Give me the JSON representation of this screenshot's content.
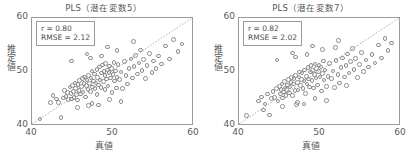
{
  "figure": {
    "width": 415,
    "height": 155,
    "background": "#ffffff",
    "marker_color": "#8d8d8d",
    "axis_color": "#9a9a9a",
    "text_color": "#5a5a5a"
  },
  "chart_data": [
    {
      "type": "scatter",
      "title": "PLS（潜在変数5）",
      "xlabel": "真値",
      "ylabel": "推定値",
      "xlim": [
        40,
        60
      ],
      "ylim": [
        40,
        60
      ],
      "xticks": [
        40,
        50,
        60
      ],
      "yticks": [
        40,
        50,
        60
      ],
      "xtick_labels": [
        "40",
        "50",
        "60"
      ],
      "ytick_labels": [
        "40",
        "50",
        "60"
      ],
      "grid": false,
      "legend": null,
      "reference_line": {
        "type": "identity",
        "from": [
          40,
          40
        ],
        "to": [
          60,
          60
        ],
        "style": "dotted"
      },
      "annotations": {
        "r_label": "r = 0.80",
        "rmse_label": "RMSE = 2.12",
        "r": 0.8,
        "rmse": 2.12
      },
      "marker": {
        "shape": "circle",
        "filled": false,
        "size": 4.6
      },
      "points": [
        [
          41.0,
          41.3
        ],
        [
          42.3,
          44.4
        ],
        [
          42.6,
          45.6
        ],
        [
          43.0,
          45.0
        ],
        [
          43.3,
          44.3
        ],
        [
          43.6,
          41.6
        ],
        [
          43.9,
          45.2
        ],
        [
          44.0,
          46.6
        ],
        [
          44.2,
          45.5
        ],
        [
          44.4,
          46.2
        ],
        [
          44.5,
          44.9
        ],
        [
          44.7,
          47.2
        ],
        [
          44.8,
          46.0
        ],
        [
          44.9,
          45.0
        ],
        [
          45.0,
          47.5
        ],
        [
          45.1,
          46.4
        ],
        [
          45.2,
          45.3
        ],
        [
          45.3,
          48.0
        ],
        [
          45.4,
          46.9
        ],
        [
          45.5,
          45.8
        ],
        [
          45.6,
          44.8
        ],
        [
          45.7,
          47.7
        ],
        [
          45.8,
          46.6
        ],
        [
          45.9,
          48.4
        ],
        [
          46.0,
          45.9
        ],
        [
          46.1,
          47.3
        ],
        [
          46.2,
          48.8
        ],
        [
          46.3,
          46.3
        ],
        [
          46.4,
          47.9
        ],
        [
          46.5,
          49.1
        ],
        [
          46.6,
          45.4
        ],
        [
          46.7,
          47.5
        ],
        [
          46.8,
          48.5
        ],
        [
          46.9,
          46.8
        ],
        [
          47.0,
          49.4
        ],
        [
          47.0,
          43.8
        ],
        [
          47.1,
          47.9
        ],
        [
          47.2,
          46.4
        ],
        [
          47.3,
          48.9
        ],
        [
          47.4,
          50.2
        ],
        [
          47.5,
          47.2
        ],
        [
          47.6,
          48.3
        ],
        [
          47.7,
          49.6
        ],
        [
          47.8,
          46.9
        ],
        [
          47.9,
          48.0
        ],
        [
          48.0,
          50.5
        ],
        [
          48.0,
          45.8
        ],
        [
          48.1,
          49.0
        ],
        [
          48.2,
          47.6
        ],
        [
          48.3,
          50.9
        ],
        [
          48.4,
          48.5
        ],
        [
          48.5,
          47.1
        ],
        [
          48.6,
          49.8
        ],
        [
          48.7,
          51.3
        ],
        [
          48.8,
          48.2
        ],
        [
          48.9,
          50.1
        ],
        [
          49.0,
          46.8
        ],
        [
          49.0,
          49.3
        ],
        [
          49.1,
          51.6
        ],
        [
          49.2,
          48.7
        ],
        [
          49.3,
          50.4
        ],
        [
          49.4,
          47.4
        ],
        [
          49.5,
          49.9
        ],
        [
          49.6,
          51.1
        ],
        [
          49.7,
          48.9
        ],
        [
          49.8,
          50.7
        ],
        [
          49.9,
          46.2
        ],
        [
          50.0,
          49.5
        ],
        [
          50.1,
          51.8
        ],
        [
          50.2,
          48.3
        ],
        [
          50.3,
          50.2
        ],
        [
          50.4,
          47.0
        ],
        [
          50.5,
          49.0
        ],
        [
          50.6,
          51.4
        ],
        [
          50.8,
          48.6
        ],
        [
          51.0,
          50.0
        ],
        [
          51.2,
          46.9
        ],
        [
          51.4,
          51.9
        ],
        [
          51.6,
          49.3
        ],
        [
          51.8,
          47.8
        ],
        [
          52.0,
          50.6
        ],
        [
          52.2,
          52.4
        ],
        [
          52.4,
          48.9
        ],
        [
          52.6,
          51.0
        ],
        [
          52.8,
          53.1
        ],
        [
          53.0,
          49.6
        ],
        [
          53.2,
          51.7
        ],
        [
          53.4,
          54.1
        ],
        [
          53.6,
          50.3
        ],
        [
          53.8,
          52.3
        ],
        [
          54.0,
          48.8
        ],
        [
          54.2,
          51.2
        ],
        [
          54.5,
          53.4
        ],
        [
          54.8,
          49.9
        ],
        [
          55.0,
          52.0
        ],
        [
          55.3,
          50.7
        ],
        [
          55.6,
          53.0
        ],
        [
          56.0,
          51.5
        ],
        [
          56.5,
          54.8
        ],
        [
          57.0,
          52.4
        ],
        [
          57.5,
          56.0
        ],
        [
          58.0,
          53.8
        ],
        [
          58.5,
          55.2
        ],
        [
          44.9,
          52.0
        ],
        [
          46.8,
          53.3
        ],
        [
          49.3,
          54.6
        ],
        [
          50.5,
          54.0
        ],
        [
          48.6,
          53.0
        ],
        [
          52.5,
          55.6
        ],
        [
          47.2,
          52.6
        ],
        [
          45.6,
          43.4
        ],
        [
          47.4,
          44.2
        ],
        [
          49.6,
          44.9
        ],
        [
          51.0,
          44.5
        ],
        [
          48.2,
          43.9
        ]
      ]
    },
    {
      "type": "scatter",
      "title": "PLS（潜在変数7）",
      "xlabel": "真値",
      "ylabel": "推定値",
      "xlim": [
        40,
        60
      ],
      "ylim": [
        40,
        60
      ],
      "xticks": [
        40,
        50,
        60
      ],
      "yticks": [
        40,
        50,
        60
      ],
      "xtick_labels": [
        "40",
        "50",
        "60"
      ],
      "ytick_labels": [
        "40",
        "50",
        "60"
      ],
      "grid": false,
      "legend": null,
      "reference_line": {
        "type": "identity",
        "from": [
          40,
          40
        ],
        "to": [
          60,
          60
        ],
        "style": "dotted"
      },
      "annotations": {
        "r_label": "r = 0.82",
        "rmse_label": "RMSE = 2.02",
        "r": 0.82,
        "rmse": 2.02
      },
      "marker": {
        "shape": "circle",
        "filled": false,
        "size": 4.6
      },
      "points": [
        [
          40.9,
          41.9
        ],
        [
          42.4,
          44.6
        ],
        [
          42.8,
          45.4
        ],
        [
          43.2,
          44.1
        ],
        [
          43.5,
          45.9
        ],
        [
          43.8,
          42.0
        ],
        [
          44.0,
          45.1
        ],
        [
          44.2,
          46.4
        ],
        [
          44.4,
          45.3
        ],
        [
          44.6,
          46.9
        ],
        [
          44.8,
          44.6
        ],
        [
          45.0,
          47.3
        ],
        [
          45.1,
          45.9
        ],
        [
          45.2,
          46.8
        ],
        [
          45.3,
          47.8
        ],
        [
          45.4,
          45.2
        ],
        [
          45.5,
          46.3
        ],
        [
          45.6,
          48.2
        ],
        [
          45.7,
          47.0
        ],
        [
          45.8,
          45.7
        ],
        [
          45.9,
          46.8
        ],
        [
          46.0,
          47.6
        ],
        [
          46.1,
          48.6
        ],
        [
          46.2,
          46.1
        ],
        [
          46.3,
          47.2
        ],
        [
          46.4,
          48.1
        ],
        [
          46.5,
          49.0
        ],
        [
          46.6,
          45.6
        ],
        [
          46.7,
          47.8
        ],
        [
          46.8,
          48.8
        ],
        [
          46.9,
          46.6
        ],
        [
          47.0,
          49.3
        ],
        [
          47.1,
          44.0
        ],
        [
          47.2,
          48.1
        ],
        [
          47.3,
          46.7
        ],
        [
          47.4,
          49.1
        ],
        [
          47.5,
          50.0
        ],
        [
          47.6,
          47.5
        ],
        [
          47.7,
          48.6
        ],
        [
          47.8,
          49.8
        ],
        [
          47.9,
          46.9
        ],
        [
          48.0,
          48.3
        ],
        [
          48.1,
          50.4
        ],
        [
          48.2,
          46.0
        ],
        [
          48.3,
          49.2
        ],
        [
          48.4,
          47.8
        ],
        [
          48.5,
          50.8
        ],
        [
          48.6,
          48.7
        ],
        [
          48.7,
          47.2
        ],
        [
          48.8,
          50.0
        ],
        [
          48.9,
          51.2
        ],
        [
          49.0,
          48.4
        ],
        [
          49.1,
          50.3
        ],
        [
          49.2,
          47.0
        ],
        [
          49.3,
          49.5
        ],
        [
          49.4,
          51.5
        ],
        [
          49.5,
          48.9
        ],
        [
          49.6,
          50.6
        ],
        [
          49.7,
          47.6
        ],
        [
          49.8,
          50.1
        ],
        [
          49.9,
          51.3
        ],
        [
          50.0,
          49.1
        ],
        [
          50.1,
          50.9
        ],
        [
          50.2,
          46.5
        ],
        [
          50.3,
          49.7
        ],
        [
          50.4,
          52.0
        ],
        [
          50.5,
          48.5
        ],
        [
          50.6,
          50.4
        ],
        [
          50.8,
          47.3
        ],
        [
          51.0,
          49.2
        ],
        [
          51.2,
          51.6
        ],
        [
          51.4,
          48.8
        ],
        [
          51.6,
          50.2
        ],
        [
          51.8,
          47.1
        ],
        [
          52.0,
          52.1
        ],
        [
          52.2,
          49.5
        ],
        [
          52.4,
          48.0
        ],
        [
          52.6,
          50.8
        ],
        [
          52.8,
          52.6
        ],
        [
          53.0,
          49.1
        ],
        [
          53.2,
          51.2
        ],
        [
          53.4,
          53.3
        ],
        [
          53.6,
          49.8
        ],
        [
          53.8,
          51.9
        ],
        [
          54.0,
          54.3
        ],
        [
          54.2,
          50.5
        ],
        [
          54.4,
          52.5
        ],
        [
          54.6,
          49.0
        ],
        [
          54.9,
          51.4
        ],
        [
          55.1,
          53.6
        ],
        [
          55.4,
          50.1
        ],
        [
          55.7,
          52.2
        ],
        [
          56.0,
          50.9
        ],
        [
          56.4,
          53.2
        ],
        [
          56.8,
          51.7
        ],
        [
          57.2,
          55.0
        ],
        [
          57.6,
          52.6
        ],
        [
          58.0,
          56.2
        ],
        [
          58.4,
          54.0
        ],
        [
          58.8,
          55.4
        ],
        [
          44.7,
          52.2
        ],
        [
          46.6,
          53.5
        ],
        [
          49.1,
          54.8
        ],
        [
          50.3,
          54.2
        ],
        [
          48.4,
          53.2
        ],
        [
          52.3,
          55.8
        ],
        [
          47.0,
          52.8
        ],
        [
          51.9,
          54.5
        ],
        [
          45.4,
          43.6
        ],
        [
          47.2,
          44.4
        ],
        [
          49.4,
          45.1
        ],
        [
          50.8,
          44.7
        ],
        [
          48.0,
          44.1
        ],
        [
          53.3,
          47.5
        ],
        [
          43.0,
          43.0
        ]
      ]
    }
  ]
}
